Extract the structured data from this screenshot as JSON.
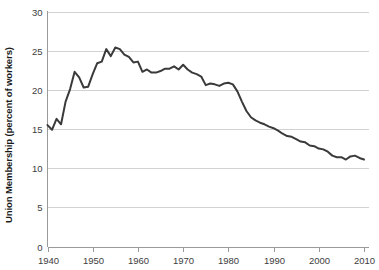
{
  "chart_data": {
    "type": "line",
    "title": "",
    "subtitle": "",
    "xlabel": "",
    "ylabel": "Union Membership (percent of workers)",
    "xlim": [
      1940,
      2011
    ],
    "ylim": [
      0,
      30
    ],
    "grid": true,
    "grid_axis": "y",
    "legend": false,
    "legend_position": "none",
    "line_color": "#3a3a3a",
    "gridline_color": "#d2d2d2",
    "axis_color": "#9a9a9a",
    "background_color": "#ffffff",
    "y_ticks": [
      0,
      5,
      10,
      15,
      20,
      25,
      30
    ],
    "y_tick_labels": [
      "0",
      "5",
      "10",
      "15",
      "20",
      "25",
      "30"
    ],
    "x_ticks": [
      1940,
      1950,
      1960,
      1970,
      1980,
      1990,
      2000,
      2010
    ],
    "x_tick_labels": [
      "1940",
      "1950",
      "1960",
      "1970",
      "1980",
      "1990",
      "2000",
      "2010"
    ],
    "x_minor_step": 1,
    "series": [
      {
        "name": "Union Membership",
        "x": [
          1940,
          1941,
          1942,
          1943,
          1944,
          1945,
          1946,
          1947,
          1948,
          1949,
          1950,
          1951,
          1952,
          1953,
          1954,
          1955,
          1956,
          1957,
          1958,
          1959,
          1960,
          1961,
          1962,
          1963,
          1964,
          1965,
          1966,
          1967,
          1968,
          1969,
          1970,
          1971,
          1972,
          1973,
          1974,
          1975,
          1976,
          1977,
          1978,
          1979,
          1980,
          1981,
          1982,
          1983,
          1984,
          1985,
          1986,
          1987,
          1988,
          1989,
          1990,
          1991,
          1992,
          1993,
          1994,
          1995,
          1996,
          1997,
          1998,
          1999,
          2000,
          2001,
          2002,
          2003,
          2004,
          2005,
          2006,
          2007,
          2008,
          2009,
          2010
        ],
        "values": [
          15.5,
          14.9,
          16.3,
          15.6,
          18.5,
          20.1,
          22.3,
          21.6,
          20.3,
          20.4,
          22.0,
          23.4,
          23.6,
          25.2,
          24.3,
          25.4,
          25.2,
          24.5,
          24.2,
          23.5,
          23.6,
          22.3,
          22.6,
          22.2,
          22.2,
          22.4,
          22.7,
          22.7,
          23.0,
          22.6,
          23.2,
          22.6,
          22.2,
          22.0,
          21.7,
          20.6,
          20.8,
          20.7,
          20.5,
          20.8,
          20.9,
          20.7,
          19.8,
          18.5,
          17.3,
          16.5,
          16.1,
          15.8,
          15.6,
          15.3,
          15.1,
          14.8,
          14.4,
          14.1,
          14.0,
          13.7,
          13.4,
          13.3,
          12.9,
          12.8,
          12.5,
          12.4,
          12.1,
          11.6,
          11.4,
          11.4,
          11.1,
          11.5,
          11.6,
          11.3,
          11.1
        ]
      }
    ]
  },
  "axis": {
    "y_label": "Union Membership (percent of workers)"
  }
}
